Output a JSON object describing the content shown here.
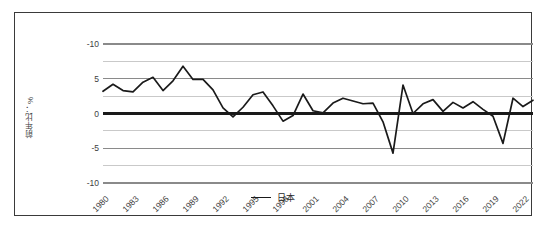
{
  "chart_data": {
    "type": "line",
    "title": "",
    "xlabel": "",
    "ylabel": "前年比：%",
    "ylim": [
      -10,
      10
    ],
    "xlim": [
      1980,
      2023
    ],
    "grid": true,
    "legend_position": "bottom",
    "y_ticks": [
      10,
      5,
      0,
      -5,
      -10
    ],
    "y_tick_labels": [
      "-10",
      "5",
      "0",
      "-5",
      "-10"
    ],
    "y_minor_gridlines": [
      7.5,
      2.5,
      -2.5,
      -7.5
    ],
    "x_ticks": [
      1980,
      1983,
      1986,
      1989,
      1992,
      1995,
      1998,
      2001,
      2004,
      2007,
      2010,
      2013,
      2016,
      2019,
      2022
    ],
    "x_tick_labels": [
      "1980",
      "1983",
      "1986",
      "1989",
      "1992",
      "1995",
      "1998",
      "2001",
      "2004",
      "2007",
      "2010",
      "2013",
      "2016",
      "2019",
      "2022"
    ],
    "series": [
      {
        "name": "日本",
        "color": "#1a1a1a",
        "x": [
          1980,
          1981,
          1982,
          1983,
          1984,
          1985,
          1986,
          1987,
          1988,
          1989,
          1990,
          1991,
          1992,
          1993,
          1994,
          1995,
          1996,
          1997,
          1998,
          1999,
          2000,
          2001,
          2002,
          2003,
          2004,
          2005,
          2006,
          2007,
          2008,
          2009,
          2010,
          2011,
          2012,
          2013,
          2014,
          2015,
          2016,
          2017,
          2018,
          2019,
          2020,
          2021,
          2022,
          2023
        ],
        "values": [
          3.2,
          4.2,
          3.3,
          3.1,
          4.5,
          5.2,
          3.3,
          4.7,
          6.8,
          4.9,
          4.9,
          3.4,
          0.8,
          -0.5,
          0.9,
          2.7,
          3.1,
          1.1,
          -1.1,
          -0.3,
          2.8,
          0.4,
          0.1,
          1.5,
          2.2,
          1.8,
          1.4,
          1.5,
          -1.2,
          -5.7,
          4.1,
          0.0,
          1.4,
          2.0,
          0.3,
          1.6,
          0.8,
          1.7,
          0.6,
          -0.4,
          -4.3,
          2.2,
          1.0,
          1.9
        ]
      }
    ]
  },
  "legend": {
    "series_label": "日本",
    "swatch": "line-swatch"
  },
  "axes": {
    "y_title": "前年比：%"
  }
}
